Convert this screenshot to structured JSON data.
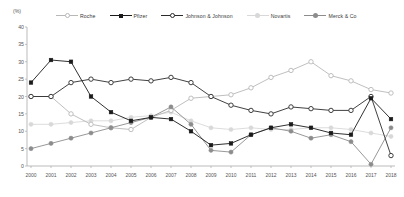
{
  "axis": {
    "y_unit_label": "(%)",
    "y_ticks": [
      "0",
      "5",
      "10",
      "15",
      "20",
      "25",
      "30",
      "35",
      "40"
    ],
    "x_ticks": [
      "2000",
      "2001",
      "2002",
      "2003",
      "2004",
      "2005",
      "2006",
      "2007",
      "2008",
      "2009",
      "2010",
      "2011",
      "2012",
      "2013",
      "2014",
      "2015",
      "2016",
      "2017",
      "2018"
    ]
  },
  "legend": [
    {
      "label": "Roche",
      "color": "#b8b8b8",
      "marker": "open-circle",
      "icon": "roche-legend-icon"
    },
    {
      "label": "Pfizer",
      "color": "#1a1a1a",
      "marker": "filled-square",
      "icon": "pfizer-legend-icon"
    },
    {
      "label": "Johnson & Johnson",
      "color": "#2b2b2b",
      "marker": "open-circle",
      "icon": "johnson-legend-icon"
    },
    {
      "label": "Novartis",
      "color": "#d8d8d8",
      "marker": "filled-circle",
      "icon": "novartis-legend-icon"
    },
    {
      "label": "Merck & Co",
      "color": "#8c8c8c",
      "marker": "filled-circle",
      "icon": "merck-legend-icon"
    }
  ],
  "chart_data": {
    "type": "line",
    "title": "",
    "xlabel": "",
    "ylabel": "(%)",
    "ylim": [
      0,
      40
    ],
    "grid": false,
    "legend_position": "top",
    "x": [
      "2000",
      "2001",
      "2002",
      "2003",
      "2004",
      "2005",
      "2006",
      "2007",
      "2008",
      "2009",
      "2010",
      "2011",
      "2012",
      "2013",
      "2014",
      "2015",
      "2016",
      "2017",
      "2018"
    ],
    "series": [
      {
        "name": "Roche",
        "color": "#b8b8b8",
        "marker": "open-circle",
        "values": [
          20.0,
          20.0,
          15.0,
          12.0,
          11.0,
          10.5,
          14.0,
          16.0,
          19.5,
          20.0,
          20.5,
          22.5,
          25.5,
          27.5,
          30.0,
          26.0,
          24.5,
          22.0,
          21.0
        ]
      },
      {
        "name": "Pfizer",
        "color": "#1a1a1a",
        "marker": "filled-square",
        "values": [
          24.0,
          30.5,
          30.0,
          20.0,
          15.5,
          13.0,
          14.0,
          13.5,
          10.0,
          6.0,
          6.5,
          9.0,
          11.0,
          12.0,
          11.0,
          9.5,
          9.0,
          19.5,
          13.5
        ]
      },
      {
        "name": "Johnson & Johnson",
        "color": "#2b2b2b",
        "marker": "open-circle",
        "values": [
          20.0,
          20.0,
          24.0,
          25.0,
          24.0,
          25.0,
          24.5,
          25.5,
          24.0,
          20.0,
          17.5,
          16.0,
          15.0,
          17.0,
          16.5,
          16.0,
          16.0,
          20.0,
          3.0
        ]
      },
      {
        "name": "Novartis",
        "color": "#d8d8d8",
        "marker": "filled-circle",
        "values": [
          12.0,
          12.0,
          12.5,
          13.0,
          13.0,
          14.0,
          14.5,
          15.5,
          13.0,
          11.0,
          10.5,
          11.0,
          10.5,
          10.5,
          11.0,
          11.0,
          10.5,
          9.5,
          8.5
        ]
      },
      {
        "name": "Merck & Co",
        "color": "#8c8c8c",
        "marker": "filled-circle",
        "values": [
          5.0,
          6.5,
          8.0,
          9.5,
          11.0,
          12.5,
          14.0,
          17.0,
          12.0,
          4.5,
          4.0,
          9.0,
          11.0,
          10.0,
          8.0,
          9.0,
          7.0,
          0.5,
          11.0
        ]
      }
    ]
  }
}
